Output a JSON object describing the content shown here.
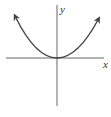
{
  "diagram": {
    "type": "function-graph",
    "curve": "parabola opening upward with vertex at origin",
    "axes": {
      "x_label": "x",
      "y_label": "y"
    },
    "colors": {
      "axis": "#555555",
      "curve": "#444444",
      "label": "#333333",
      "background": "#ffffff"
    }
  }
}
